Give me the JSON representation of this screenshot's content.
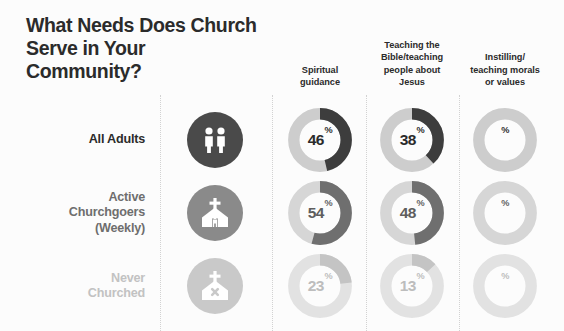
{
  "title": "What Needs Does Church Serve in Your Community?",
  "background_color": "#fcfcfc",
  "columns": [
    {
      "id": "spiritual-guidance",
      "label": "Spiritual\nguidance",
      "center_x": 320
    },
    {
      "id": "teaching-bible",
      "label": "Teaching the\nBible/teaching\npeople about\nJesus",
      "center_x": 412
    },
    {
      "id": "instilling-morals",
      "label": "Instilling/\nteaching morals\nor values",
      "center_x": 505
    }
  ],
  "rows": [
    {
      "id": "all-adults",
      "label": "All Adults",
      "label_color": "#2b2b2b",
      "icon": "two-people-icon",
      "icon_bg": "#4a4a4a",
      "arc_color": "#3d3d3d",
      "track_color": "#cdcdcd",
      "value_color": "#2b2b2b",
      "center_y": 140
    },
    {
      "id": "active-churchgoers",
      "label": "Active\nChurchgoers\n(Weekly)",
      "label_color": "#6e6e6e",
      "icon": "church-person-icon",
      "icon_bg": "#8a8a8a",
      "arc_color": "#6f6f6f",
      "track_color": "#d6d6d6",
      "value_color": "#5e5e5e",
      "center_y": 213
    },
    {
      "id": "never-churched",
      "label": "Never\nChurched",
      "label_color": "#c2c2c2",
      "icon": "church-x-icon",
      "icon_bg": "#c9c9c9",
      "arc_color": "#c4c4c4",
      "track_color": "#e2e2e2",
      "value_color": "#bdbdbd",
      "center_y": 286
    }
  ],
  "chart_data": {
    "type": "pie",
    "title": "What Needs Does Church Serve in Your Community?",
    "categories": [
      "Spiritual guidance",
      "Teaching the Bible/teaching people about Jesus",
      "Instilling/teaching morals or values"
    ],
    "series": [
      {
        "name": "All Adults",
        "values": [
          46,
          38,
          38
        ]
      },
      {
        "name": "Active Churchgoers (Weekly)",
        "values": [
          54,
          48,
          42
        ]
      },
      {
        "name": "Never Churched",
        "values": [
          23,
          13,
          17
        ]
      }
    ],
    "unit": "%",
    "ylim": [
      0,
      100
    ],
    "grid": false,
    "legend": "none",
    "cells": [
      {
        "row": "All Adults",
        "column": "Spiritual guidance",
        "value": 46,
        "display": "46%"
      },
      {
        "row": "All Adults",
        "column": "Teaching the Bible/teaching people about Jesus",
        "value": 38,
        "display": "38%"
      },
      {
        "row": "All Adults",
        "column": "Instilling/teaching morals or values",
        "value": 38,
        "display": "38%"
      },
      {
        "row": "Active Churchgoers (Weekly)",
        "column": "Spiritual guidance",
        "value": 54,
        "display": "54%"
      },
      {
        "row": "Active Churchgoers (Weekly)",
        "column": "Teaching the Bible/teaching people about Jesus",
        "value": 48,
        "display": "48%"
      },
      {
        "row": "Active Churchgoers (Weekly)",
        "column": "Instilling/teaching morals or values",
        "value": 42,
        "display": "42%"
      },
      {
        "row": "Never Churched",
        "column": "Spiritual guidance",
        "value": 23,
        "display": "23%"
      },
      {
        "row": "Never Churched",
        "column": "Teaching the Bible/teaching people about Jesus",
        "value": 13,
        "display": "13%"
      },
      {
        "row": "Never Churched",
        "column": "Instilling/teaching morals or values",
        "value": 17,
        "display": "17%"
      }
    ]
  },
  "dividers_x": [
    160,
    272,
    366,
    459
  ]
}
